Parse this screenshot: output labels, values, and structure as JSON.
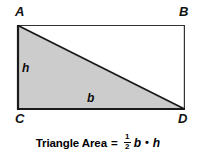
{
  "figure": {
    "background_color": "#ffffff",
    "shape_fill_color": "#cccccc",
    "stroke_color": "#1a1a1a"
  },
  "vertices": {
    "a": "A",
    "b": "B",
    "c": "C",
    "d": "D"
  },
  "side_labels": {
    "height": "h",
    "base": "b"
  },
  "formula": {
    "label": "Triangle Area",
    "equals": "=",
    "fraction_numerator": "1",
    "fraction_denominator": "2",
    "base_variable": "b",
    "operator_dot": "•",
    "height_variable": "h",
    "full_text": "Triangle Area = 1/2 b • h"
  },
  "geometry": {
    "rectangle": {
      "x": 17,
      "y": 25,
      "width": 168,
      "height": 85
    },
    "triangle_points": "17,25 17,110 185,110",
    "shaded_region": "triangle ACD"
  }
}
